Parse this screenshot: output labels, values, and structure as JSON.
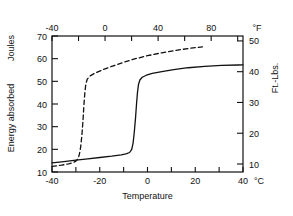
{
  "chart_data": {
    "type": "line",
    "title": "",
    "xlabel": "Temperature",
    "ylabel": "Energy absorbed",
    "y_unit_primary": "Joules",
    "y_unit_secondary": "Ft.-Lbs.",
    "x_unit_primary": "°C",
    "x_unit_secondary": "°F",
    "grid": false,
    "legend": "none",
    "xlim": [
      -40,
      40
    ],
    "ylim": [
      10,
      70
    ],
    "xlim_secondary": [
      -40,
      104
    ],
    "ylim_secondary": [
      7.4,
      51.6
    ],
    "x_ticks_bottom": [
      -40,
      -30,
      -20,
      -10,
      0,
      10,
      20,
      30,
      40
    ],
    "x_ticklabels_bottom": [
      "-40",
      "",
      "-20",
      "",
      "0",
      "",
      "20",
      "",
      "40"
    ],
    "x_ticks_top_f": [
      -40,
      -20,
      0,
      20,
      40,
      60,
      80,
      100
    ],
    "x_ticklabels_top": [
      "-40",
      "",
      "0",
      "",
      "40",
      "",
      "80",
      ""
    ],
    "y_ticks_left": [
      10,
      20,
      30,
      40,
      50,
      60,
      70
    ],
    "y_ticklabels_left": [
      "10",
      "20",
      "30",
      "40",
      "50",
      "60",
      "70"
    ],
    "y_ticks_right": [
      10,
      20,
      30,
      40,
      50
    ],
    "y_ticklabels_right": [
      "10",
      "20",
      "30",
      "40",
      "50"
    ],
    "series": [
      {
        "name": "dashed-transition-curve",
        "style": "dashed",
        "color": "#111111",
        "points": [
          [
            -40,
            12.5
          ],
          [
            -36,
            13.0
          ],
          [
            -33,
            13.6
          ],
          [
            -31,
            14.2
          ],
          [
            -30,
            14.8
          ],
          [
            -29,
            16.0
          ],
          [
            -28.5,
            18.0
          ],
          [
            -28,
            21.0
          ],
          [
            -27.5,
            26.0
          ],
          [
            -27,
            33.0
          ],
          [
            -26.6,
            40.0
          ],
          [
            -26.2,
            45.5
          ],
          [
            -25.8,
            49.0
          ],
          [
            -25.2,
            51.0
          ],
          [
            -24,
            52.4
          ],
          [
            -22,
            53.6
          ],
          [
            -19,
            55.0
          ],
          [
            -15,
            56.6
          ],
          [
            -10,
            58.4
          ],
          [
            -5,
            60.0
          ],
          [
            0,
            61.3
          ],
          [
            6,
            62.6
          ],
          [
            12,
            63.7
          ],
          [
            18,
            64.6
          ],
          [
            23,
            65.2
          ]
        ]
      },
      {
        "name": "solid-transition-curve",
        "style": "solid",
        "color": "#111111",
        "points": [
          [
            -40,
            14.0
          ],
          [
            -35,
            14.6
          ],
          [
            -30,
            15.2
          ],
          [
            -25,
            15.8
          ],
          [
            -20,
            16.4
          ],
          [
            -15,
            17.0
          ],
          [
            -11,
            17.6
          ],
          [
            -9,
            18.0
          ],
          [
            -7.5,
            18.6
          ],
          [
            -6.6,
            20.0
          ],
          [
            -6.0,
            23.0
          ],
          [
            -5.5,
            28.0
          ],
          [
            -5.0,
            34.0
          ],
          [
            -4.6,
            40.0
          ],
          [
            -4.2,
            45.0
          ],
          [
            -3.8,
            48.5
          ],
          [
            -3.2,
            50.6
          ],
          [
            -2.2,
            51.8
          ],
          [
            -0.5,
            52.7
          ],
          [
            2,
            53.5
          ],
          [
            6,
            54.3
          ],
          [
            11,
            55.2
          ],
          [
            17,
            56.0
          ],
          [
            24,
            56.6
          ],
          [
            31,
            57.0
          ],
          [
            38,
            57.2
          ],
          [
            40,
            57.3
          ]
        ]
      }
    ]
  },
  "labels": {
    "axis_left_title": "Energy absorbed",
    "axis_left_unit": "Joules",
    "axis_right_unit": "Ft.-Lbs.",
    "axis_bottom_title": "Temperature",
    "x_unit_bottom": "°C",
    "x_unit_top": "°F"
  }
}
